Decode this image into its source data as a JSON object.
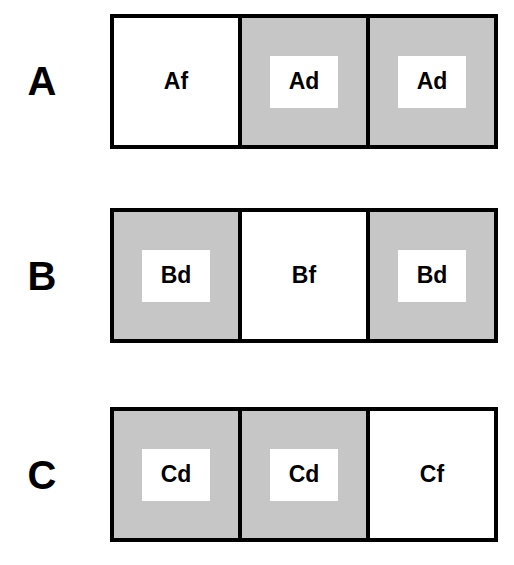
{
  "colors": {
    "filled": "#c6c6c6",
    "empty": "#ffffff",
    "border": "#000000"
  },
  "rows": [
    {
      "label": "A",
      "cells": [
        {
          "text": "Af",
          "shaded": false
        },
        {
          "text": "Ad",
          "shaded": true
        },
        {
          "text": "Ad",
          "shaded": true
        }
      ]
    },
    {
      "label": "B",
      "cells": [
        {
          "text": "Bd",
          "shaded": true
        },
        {
          "text": "Bf",
          "shaded": false
        },
        {
          "text": "Bd",
          "shaded": true
        }
      ]
    },
    {
      "label": "C",
      "cells": [
        {
          "text": "Cd",
          "shaded": true
        },
        {
          "text": "Cd",
          "shaded": true
        },
        {
          "text": "Cf",
          "shaded": false
        }
      ]
    }
  ]
}
